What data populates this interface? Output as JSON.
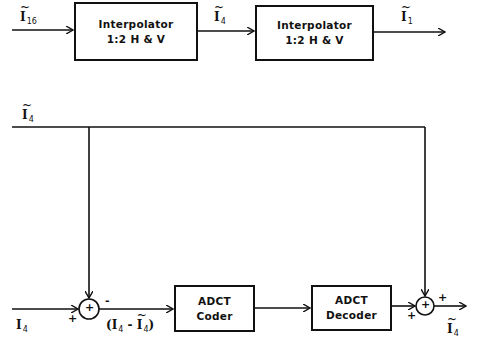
{
  "diagram": {
    "top_chain": {
      "input_label": {
        "symbol": "I",
        "subscript": "16",
        "tilde": true
      },
      "box1": {
        "line1": "Interpolator",
        "line2": "1:2 H & V"
      },
      "mid_label": {
        "symbol": "I",
        "subscript": "4",
        "tilde": true
      },
      "box2": {
        "line1": "Interpolator",
        "line2": "1:2 H & V"
      },
      "output_label": {
        "symbol": "I",
        "subscript": "1",
        "tilde": true
      }
    },
    "bottom_chain": {
      "feedback_label": {
        "symbol": "I",
        "subscript": "4",
        "tilde": true
      },
      "input_label": {
        "symbol": "I",
        "subscript": "4",
        "tilde": false
      },
      "sum1": {
        "glyph": "+",
        "sign_left": "+",
        "sign_top": "-"
      },
      "difference_label": {
        "open": "(",
        "a_symbol": "I",
        "a_sub": "4",
        "minus": " - ",
        "b_symbol": "I",
        "b_sub": "4",
        "close": ")"
      },
      "coder": {
        "line1": "ADCT",
        "line2": "Coder"
      },
      "decoder": {
        "line1": "ADCT",
        "line2": "Decoder"
      },
      "sum2": {
        "glyph": "+",
        "sign_left": "+",
        "sign_top": "+"
      },
      "output_label": {
        "symbol": "I",
        "subscript": "4",
        "tilde": true
      }
    }
  }
}
